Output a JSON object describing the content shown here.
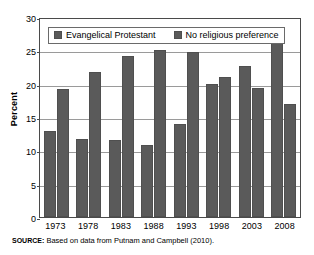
{
  "chart_data": {
    "type": "bar",
    "title": "",
    "xlabel": "",
    "ylabel": "Percent",
    "ylim": [
      0,
      30
    ],
    "yticks": [
      0,
      5,
      10,
      15,
      20,
      25,
      30
    ],
    "grid": true,
    "legend_position": "top-inside",
    "categories": [
      "1973",
      "1978",
      "1983",
      "1988",
      "1993",
      "1998",
      "2003",
      "2008"
    ],
    "series": [
      {
        "name": "Evangelical Protestant",
        "color": "#5a5a5a",
        "values": [
          12.9,
          11.7,
          11.6,
          10.8,
          14.0,
          20.0,
          22.7,
          26.3
        ]
      },
      {
        "name": "No religious preference",
        "color": "#5a5a5a",
        "values": [
          19.2,
          21.7,
          24.2,
          25.0,
          24.8,
          21.0,
          19.3,
          17.0
        ]
      }
    ],
    "source_note": {
      "kicker": "SOURCE:",
      "text": "Based on data from Putnam and Campbell (2010)."
    }
  }
}
